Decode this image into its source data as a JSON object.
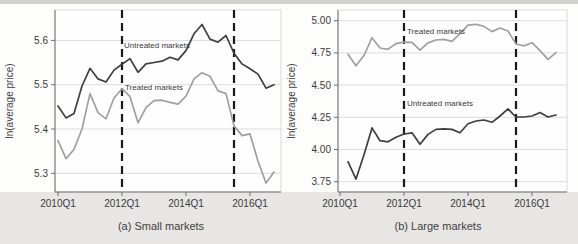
{
  "figure": {
    "y_axis_title": "ln(average price)",
    "quarters": [
      "2010Q1",
      "2010Q2",
      "2010Q3",
      "2010Q4",
      "2011Q1",
      "2011Q2",
      "2011Q3",
      "2011Q4",
      "2012Q1",
      "2012Q2",
      "2012Q3",
      "2012Q4",
      "2013Q1",
      "2013Q2",
      "2013Q3",
      "2013Q4",
      "2014Q1",
      "2014Q2",
      "2014Q3",
      "2014Q4",
      "2015Q1",
      "2015Q2",
      "2015Q3",
      "2015Q4",
      "2016Q1",
      "2016Q2",
      "2016Q3",
      "2016Q4"
    ],
    "x_tick_labels": [
      "2010Q1",
      "2012Q1",
      "2014Q1",
      "2016Q1"
    ],
    "colors": {
      "untreated_line": "#3f3f3f",
      "treated_line": "#a0a0a0",
      "untreated_label": "#4d4d4d",
      "treated_label": "#a8a8a8",
      "policy_dash": "#1a1a1a",
      "grid": "#dcdcdc",
      "frame": "#d9d9d9",
      "axis": "#6f6f6f",
      "tick_text": "#3a3a3a",
      "figure_bg": "#e7e6e4",
      "plot_bg": "#fefefe"
    }
  },
  "chart_data": [
    {
      "type": "line",
      "id": "small-markets",
      "caption": "(a) Small markets",
      "ylabel": "ln(average price)",
      "ylim": [
        5.25,
        5.67
      ],
      "y_ticks": [
        {
          "v": 5.3,
          "label": "5.3"
        },
        {
          "v": 5.4,
          "label": "5.4"
        },
        {
          "v": 5.5,
          "label": "5.5"
        },
        {
          "v": 5.6,
          "label": "5.6"
        }
      ],
      "x_ticks": [
        "2010Q1",
        "2012Q1",
        "2014Q1",
        "2016Q1"
      ],
      "vlines": [
        "2012Q1",
        "2015Q3"
      ],
      "series": [
        {
          "name": "Untreated markets",
          "role": "untreated",
          "start_quarter": "2010Q1",
          "values": [
            5.452,
            5.425,
            5.435,
            5.497,
            5.537,
            5.513,
            5.506,
            5.533,
            5.546,
            5.559,
            5.528,
            5.547,
            5.55,
            5.553,
            5.562,
            5.556,
            5.577,
            5.615,
            5.636,
            5.603,
            5.596,
            5.611,
            5.571,
            5.547,
            5.536,
            5.524,
            5.492,
            5.5
          ]
        },
        {
          "name": "Treated markets",
          "role": "treated",
          "start_quarter": "2010Q1",
          "values": [
            5.374,
            5.333,
            5.354,
            5.4,
            5.48,
            5.437,
            5.423,
            5.47,
            5.491,
            5.473,
            5.414,
            5.448,
            5.464,
            5.465,
            5.46,
            5.456,
            5.474,
            5.513,
            5.527,
            5.519,
            5.486,
            5.48,
            5.407,
            5.385,
            5.389,
            5.327,
            5.278,
            5.303
          ]
        }
      ],
      "annotations": [
        {
          "text": "Untreated markets",
          "role": "untreated"
        },
        {
          "text": "Treated markets",
          "role": "treated"
        }
      ]
    },
    {
      "type": "line",
      "id": "large-markets",
      "caption": "(b) Large markets",
      "ylabel": "ln(average price)",
      "ylim": [
        3.7,
        5.05
      ],
      "y_ticks": [
        {
          "v": 3.75,
          "label": "3.75"
        },
        {
          "v": 4.0,
          "label": "4.00"
        },
        {
          "v": 4.25,
          "label": "4.25"
        },
        {
          "v": 4.5,
          "label": "4.50"
        },
        {
          "v": 4.75,
          "label": "4.75"
        },
        {
          "v": 5.0,
          "label": "5.00"
        }
      ],
      "x_ticks": [
        "2010Q1",
        "2012Q1",
        "2014Q1",
        "2016Q1"
      ],
      "vlines": [
        "2012Q1",
        "2015Q3"
      ],
      "series": [
        {
          "name": "Untreated markets",
          "role": "untreated",
          "start_quarter": "2010Q2",
          "values": [
            3.905,
            3.77,
            3.96,
            4.168,
            4.068,
            4.06,
            4.095,
            4.12,
            4.13,
            4.04,
            4.117,
            4.156,
            4.161,
            4.156,
            4.13,
            4.2,
            4.221,
            4.229,
            4.211,
            4.26,
            4.315,
            4.252,
            4.252,
            4.26,
            4.287,
            4.252,
            4.268
          ]
        },
        {
          "name": "Treated markets",
          "role": "treated",
          "start_quarter": "2010Q2",
          "values": [
            4.739,
            4.651,
            4.73,
            4.868,
            4.788,
            4.778,
            4.822,
            4.834,
            4.832,
            4.772,
            4.828,
            4.85,
            4.855,
            4.84,
            4.9,
            4.965,
            4.972,
            4.956,
            4.915,
            4.943,
            4.92,
            4.819,
            4.804,
            4.829,
            4.767,
            4.7,
            4.752
          ]
        }
      ],
      "annotations": [
        {
          "text": "Treated markets",
          "role": "treated"
        },
        {
          "text": "Untreated markets",
          "role": "untreated"
        }
      ]
    }
  ]
}
